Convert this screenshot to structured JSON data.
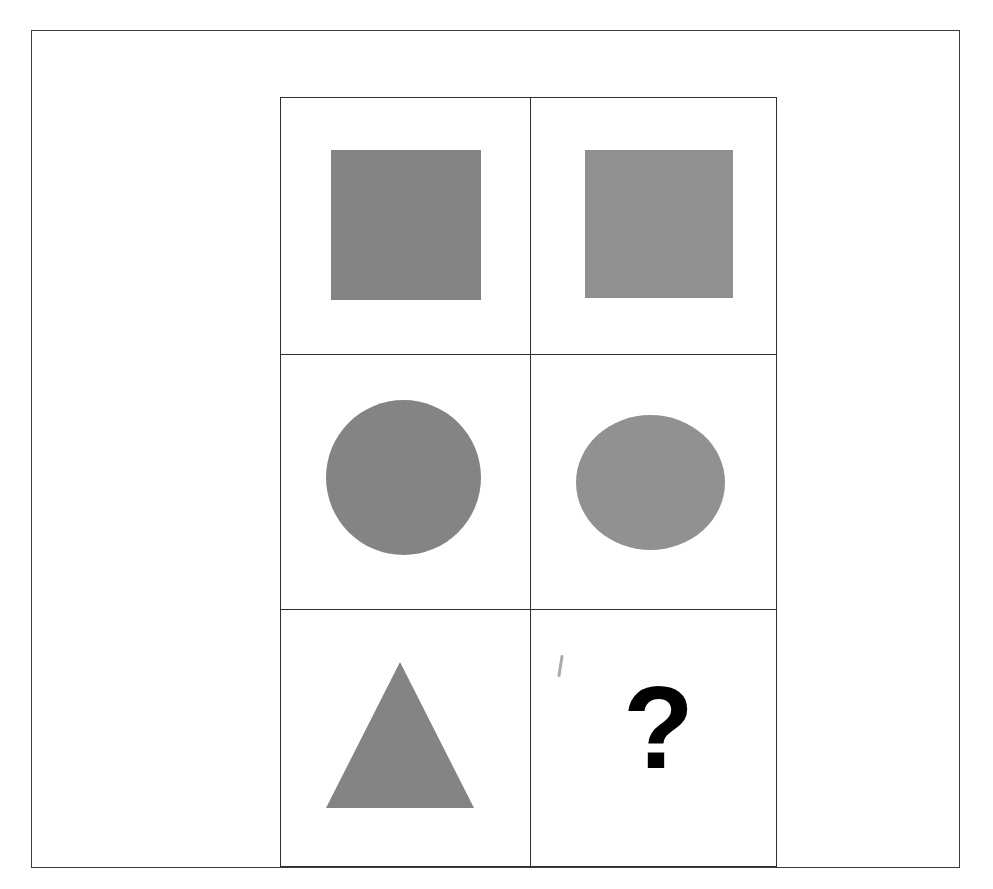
{
  "document": {
    "kind": "visual-analogy-matrix-puzzle",
    "background_color": "#ffffff",
    "outer_frame": {
      "border_color": "#3b3b3b",
      "border_width_px": 1
    }
  },
  "matrix": {
    "border_color": "#2e2e2e",
    "columns": 2,
    "rows": 3,
    "cells": [
      {
        "id": "r1c1",
        "row": 1,
        "column": 1,
        "shape": "square",
        "fill": "#848484",
        "tone": "dark",
        "label": "gray-square-dark"
      },
      {
        "id": "r1c2",
        "row": 1,
        "column": 2,
        "shape": "square",
        "fill": "#909090",
        "tone": "light",
        "label": "gray-square-light"
      },
      {
        "id": "r2c1",
        "row": 2,
        "column": 1,
        "shape": "circle",
        "fill": "#848484",
        "tone": "dark",
        "label": "gray-circle-dark"
      },
      {
        "id": "r2c2",
        "row": 2,
        "column": 2,
        "shape": "circle",
        "fill": "#919191",
        "tone": "light",
        "label": "gray-circle-light"
      },
      {
        "id": "r3c1",
        "row": 3,
        "column": 1,
        "shape": "triangle",
        "fill": "#848484",
        "tone": "dark",
        "label": "gray-triangle-dark"
      },
      {
        "id": "r3c2",
        "row": 3,
        "column": 2,
        "shape": "question-mark",
        "fill": "#000000",
        "tone": "black",
        "label": "missing-answer"
      }
    ]
  },
  "answer_cell": {
    "symbol": "?",
    "color": "#000000"
  },
  "artifacts": {
    "stray_mark_color": "#8d8d8d"
  }
}
